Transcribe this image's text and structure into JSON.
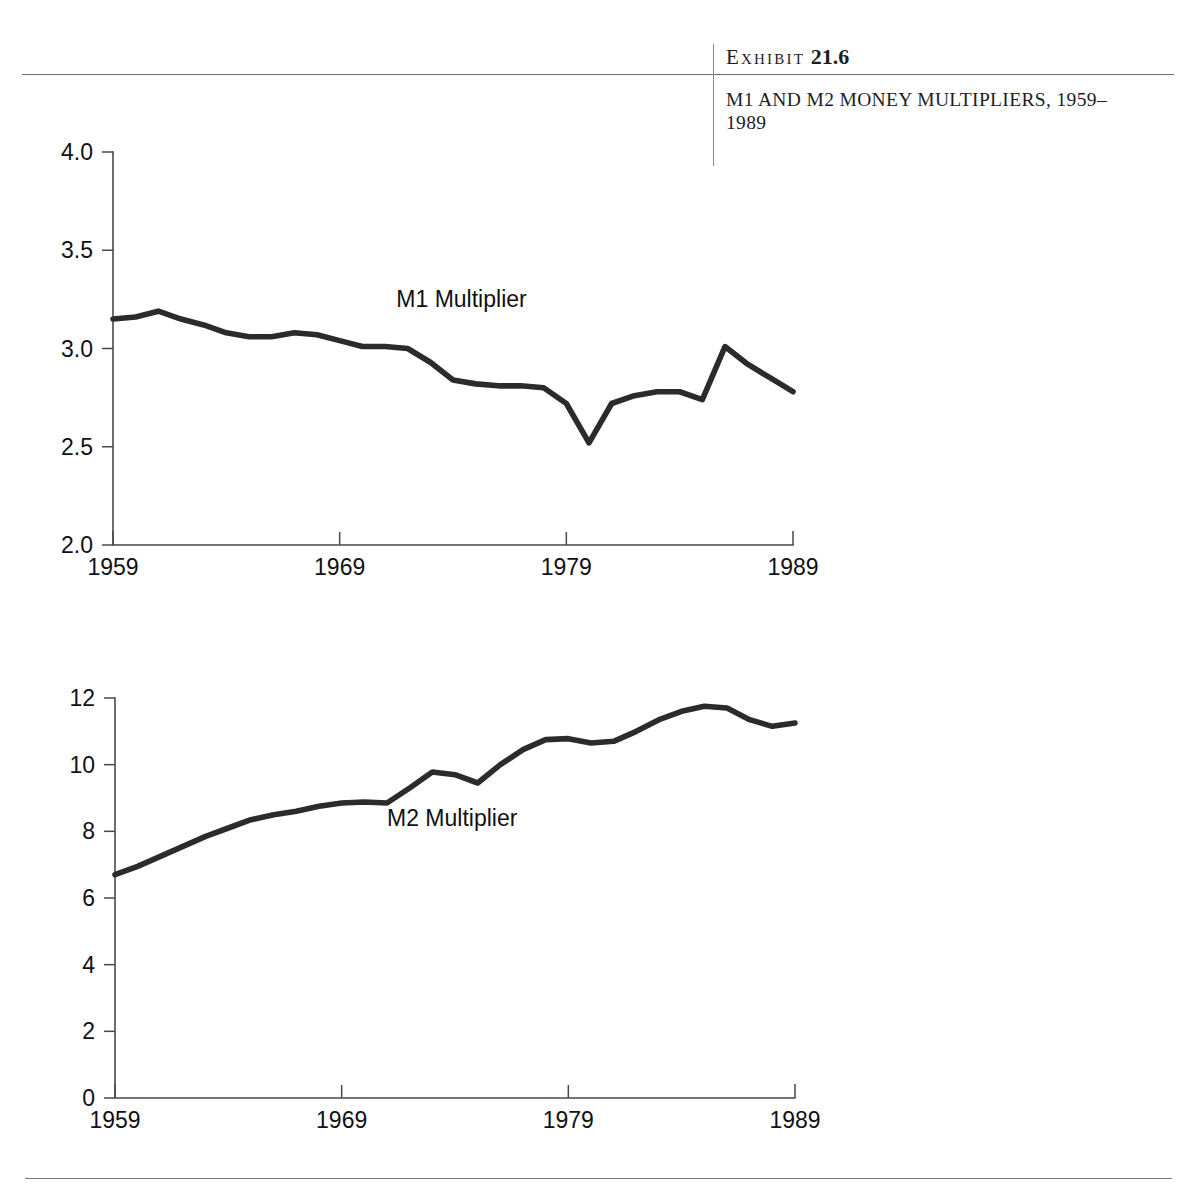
{
  "header": {
    "exhibit_word": "Exhibit",
    "exhibit_number": "21.6",
    "title": "M1 AND M2 MONEY MULTIPLIERS, 1959–1989",
    "rule_color": "#6e6e72"
  },
  "chart_data": [
    {
      "id": "m1",
      "type": "line",
      "title": "",
      "xlabel": "",
      "ylabel": "",
      "series_label": "M1 Multiplier",
      "series_label_x": 1971.5,
      "series_label_y": 3.21,
      "xlim": [
        1959,
        1989
      ],
      "ylim": [
        2.0,
        4.0
      ],
      "yticks": [
        2.0,
        2.5,
        3.0,
        3.5,
        4.0
      ],
      "ytick_labels": [
        "2.0",
        "2.5",
        "3.0",
        "3.5",
        "4.0"
      ],
      "xticks": [
        1959,
        1969,
        1979,
        1989
      ],
      "xtick_labels": [
        "1959",
        "1969",
        "1979",
        "1989"
      ],
      "grid": false,
      "legend": "inline",
      "line_color": "#2b2b2b",
      "x": [
        1959,
        1960,
        1961,
        1962,
        1963,
        1964,
        1965,
        1966,
        1967,
        1968,
        1969,
        1970,
        1971,
        1972,
        1973,
        1974,
        1975,
        1976,
        1977,
        1978,
        1979,
        1980,
        1981,
        1982,
        1983,
        1984,
        1985,
        1986,
        1987,
        1988,
        1989
      ],
      "values": [
        3.15,
        3.16,
        3.19,
        3.15,
        3.12,
        3.08,
        3.06,
        3.06,
        3.08,
        3.07,
        3.04,
        3.01,
        3.01,
        3.0,
        2.93,
        2.84,
        2.82,
        2.81,
        2.81,
        2.8,
        2.72,
        2.52,
        2.72,
        2.76,
        2.78,
        2.78,
        2.74,
        3.01,
        2.92,
        2.85,
        2.78
      ]
    },
    {
      "id": "m2",
      "type": "line",
      "title": "",
      "xlabel": "",
      "ylabel": "",
      "series_label": "M2 Multiplier",
      "series_label_x": 1971.0,
      "series_label_y": 8.15,
      "xlim": [
        1959,
        1989
      ],
      "ylim": [
        0,
        12
      ],
      "yticks": [
        0,
        2,
        4,
        6,
        8,
        10,
        12
      ],
      "ytick_labels": [
        "0",
        "2",
        "4",
        "6",
        "8",
        "10",
        "12"
      ],
      "xticks": [
        1959,
        1969,
        1979,
        1989
      ],
      "xtick_labels": [
        "1959",
        "1969",
        "1979",
        "1989"
      ],
      "grid": false,
      "legend": "inline",
      "line_color": "#2b2b2b",
      "x": [
        1959,
        1960,
        1961,
        1962,
        1963,
        1964,
        1965,
        1966,
        1967,
        1968,
        1969,
        1970,
        1971,
        1972,
        1973,
        1974,
        1975,
        1976,
        1977,
        1978,
        1979,
        1980,
        1981,
        1982,
        1983,
        1984,
        1985,
        1986,
        1987,
        1988,
        1989
      ],
      "values": [
        6.7,
        6.95,
        7.25,
        7.55,
        7.85,
        8.1,
        8.35,
        8.5,
        8.6,
        8.75,
        8.85,
        8.88,
        8.85,
        9.3,
        9.78,
        9.7,
        9.45,
        10.0,
        10.45,
        10.75,
        10.78,
        10.65,
        10.7,
        11.0,
        11.35,
        11.6,
        11.75,
        11.7,
        11.35,
        11.15,
        11.25
      ]
    }
  ]
}
